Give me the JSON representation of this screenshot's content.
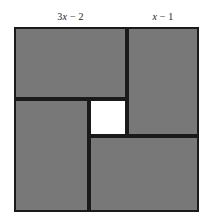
{
  "figure": {
    "labels": {
      "left": "3x − 2",
      "right": "x − 1"
    },
    "colors": {
      "piece_fill": "#787878",
      "stroke": "#1a1a1a",
      "center_fill": "#ffffff",
      "background": "#ffffff"
    },
    "pieces": [
      {
        "name": "top-rectangle",
        "long_side_label": "3x − 2",
        "short_side_label": "x − 1"
      },
      {
        "name": "right-rectangle",
        "long_side_label": "3x − 2",
        "short_side_label": "x − 1"
      },
      {
        "name": "bottom-rectangle",
        "long_side_label": "3x − 2",
        "short_side_label": "x − 1"
      },
      {
        "name": "left-rectangle",
        "long_side_label": "3x − 2",
        "short_side_label": "x − 1"
      }
    ],
    "center": {
      "name": "center-square",
      "fill": "white"
    }
  },
  "chart_data": {
    "type": "diagram",
    "title": "",
    "annotations": [
      {
        "text": "3x − 2",
        "position": "top, above left portion of square",
        "refers_to": "long side of top rectangle"
      },
      {
        "text": "x − 1",
        "position": "top, above right portion of square",
        "refers_to": "short side of top rectangle"
      }
    ]
  }
}
